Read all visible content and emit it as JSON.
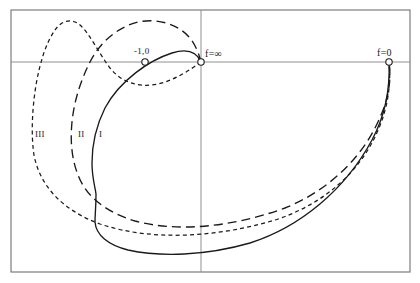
{
  "figure": {
    "type": "nyquist-polar-plot",
    "frame": {
      "x": 11,
      "y": 10,
      "width": 399,
      "height": 262
    },
    "axes": {
      "horizontal_y": 62,
      "vertical_x": 201,
      "color": "#808080"
    },
    "line_color": "#1a1a1a"
  },
  "labels": {
    "critical_point": "-1,0",
    "f_infinity": "f=∞",
    "f_zero": "f=0",
    "curve_one": "I",
    "curve_two": "II",
    "curve_three": "III"
  },
  "markers": [
    {
      "name": "critical-point-marker",
      "x": 145,
      "y": 62,
      "r": 3.2,
      "label": "-1,0"
    },
    {
      "name": "f-infinity-marker",
      "x": 201,
      "y": 62,
      "r": 3.2,
      "label": "f=∞"
    },
    {
      "name": "f-zero-marker",
      "x": 389,
      "y": 62,
      "r": 3.2,
      "label": "f=0"
    }
  ],
  "chart_data": {
    "type": "line",
    "title": "",
    "xlabel": "",
    "ylabel": "",
    "grid": false,
    "legend": "inline-curve-labels",
    "axis_style": "cartesian-cross",
    "series": [
      {
        "name": "I",
        "style": "solid",
        "label_position": {
          "x": 99,
          "y": 129
        },
        "path": "M 201 62 C 196 50, 185 49, 172 53 C 150 60, 120 80, 105 108 C 96 126, 92 146, 92 163 C 92 178, 95 186, 96 194 C 96 208, 95 214, 95 222 C 96 235, 108 245, 128 250 C 160 257, 205 256, 250 243 C 300 227, 345 190, 372 140 C 386 114, 390 86, 389 62"
      },
      {
        "name": "II",
        "style": "long-dash",
        "label_position": {
          "x": 78,
          "y": 129
        },
        "path": "M 201 62 C 199 54, 196 46, 190 38 C 178 24, 158 18, 138 22 C 118 27, 100 42, 90 62 C 80 82, 74 102, 72 122 C 70 142, 72 160, 78 175 C 86 196, 105 212, 135 221 C 175 232, 230 228, 285 208 C 330 190, 365 155, 381 115 C 390 95, 391 76, 389 62"
      },
      {
        "name": "III",
        "style": "short-dash",
        "label_position": {
          "x": 35,
          "y": 129
        },
        "path": "M 201 62 C 190 70, 175 80, 158 84 C 140 88, 122 83, 110 68 C 98 52, 90 34, 80 25 C 72 18, 62 20, 55 30 C 46 43, 40 62, 36 85 C 32 110, 31 135, 34 155 C 40 186, 62 210, 100 224 C 150 241, 215 238, 275 220 C 325 204, 362 170, 379 128 C 389 104, 391 80, 389 62"
      }
    ]
  }
}
